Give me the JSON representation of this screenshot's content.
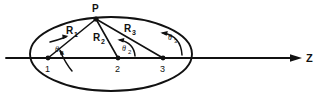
{
  "figure": {
    "type": "geometry-diagram",
    "background_color": "#ffffff",
    "stroke_color": "#111111",
    "width": 329,
    "height": 104
  },
  "axis": {
    "label": "Z",
    "name": "z-axis",
    "orientation": "horizontal",
    "arrow": "right"
  },
  "apex": {
    "label": "P",
    "x": 96,
    "y": 19
  },
  "boundary": {
    "shape": "ellipse",
    "center_x": 111,
    "center_y": 54,
    "radius_x": 81,
    "radius_y": 37
  },
  "source_points": [
    {
      "label": "1",
      "x": 48,
      "y": 58
    },
    {
      "label": "2",
      "x": 118,
      "y": 58
    },
    {
      "label": "3",
      "x": 163,
      "y": 58
    }
  ],
  "rays": [
    {
      "label": "R",
      "subscript": "1",
      "from": "1",
      "to": "P",
      "label_x": 70,
      "label_y": 33
    },
    {
      "label": "R",
      "subscript": "2",
      "from": "2",
      "to": "P",
      "label_x": 97,
      "label_y": 40
    },
    {
      "label": "R",
      "subscript": "3",
      "from": "3",
      "to": "P",
      "label_x": 127,
      "label_y": 31
    }
  ],
  "angles": [
    {
      "label": "θ",
      "subscript": "1",
      "vertex": "1",
      "label_x": 57,
      "label_y": 53
    },
    {
      "label": "θ",
      "subscript": "2",
      "vertex": "2",
      "label_x": 124,
      "label_y": 52
    },
    {
      "label": "θ",
      "subscript": "3",
      "vertex": "3",
      "label_x": 170,
      "label_y": 41
    }
  ]
}
